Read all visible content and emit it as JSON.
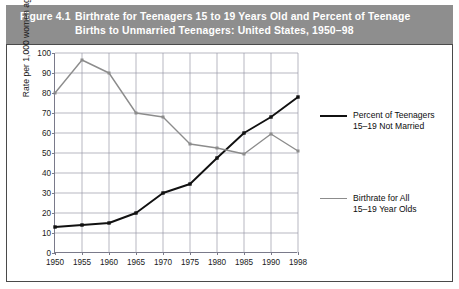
{
  "figure": {
    "number": "Figure 4.1",
    "title_line1": "Birthrate for Teenagers 15 to 19 Years Old and Percent of Teenage",
    "title_line2": "Births to Unmarried Teenagers: United States, 1950–98",
    "header_color": "#8e8e8e",
    "frame_color": "#4a4a4a"
  },
  "chart_data": {
    "type": "line",
    "title": "Birthrate for Teenagers 15 to 19 Years Old and Percent of Teenage Births to Unmarried Teenagers: United States, 1950–98",
    "xlabel": "",
    "ylabel": "Rate per 1,000 women aged 15-19 years",
    "x": [
      1950,
      1955,
      1960,
      1965,
      1970,
      1975,
      1980,
      1985,
      1990,
      1998
    ],
    "xtick_labels": [
      "1950",
      "1955",
      "1960",
      "1965",
      "1970",
      "1975",
      "1980",
      "1985",
      "1990",
      "1998"
    ],
    "ytick_labels": [
      "0",
      "10",
      "20",
      "30",
      "40",
      "50",
      "60",
      "70",
      "80",
      "90",
      "100"
    ],
    "yticks": [
      0,
      10,
      20,
      30,
      40,
      50,
      60,
      70,
      80,
      90,
      100
    ],
    "ylim": [
      0,
      100
    ],
    "xlim": [
      1950,
      1998
    ],
    "grid": true,
    "legend_position": "right",
    "series": [
      {
        "name": "Percent of Teenagers 15–19 Not Married",
        "legend_line1": "Percent of Teenagers",
        "legend_line2": "15–19 Not Married",
        "color": "#111111",
        "values": [
          13,
          14,
          15,
          20,
          30,
          34.5,
          47.5,
          60,
          68,
          78
        ]
      },
      {
        "name": "Birthrate for All 15–19 Year Olds",
        "legend_line1": "Birthrate for All",
        "legend_line2": "15–19 Year Olds",
        "color": "#8c8c8c",
        "values": [
          80,
          96.5,
          90,
          70,
          68,
          54.5,
          52.5,
          49.5,
          59.5,
          51
        ]
      }
    ]
  }
}
